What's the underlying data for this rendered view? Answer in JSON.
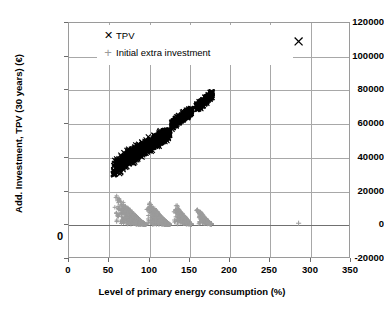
{
  "chart_data": {
    "type": "scatter",
    "title": "",
    "xlabel": "Level of primary energy consumption (%)",
    "ylabel": "Add. Investment, TPV (30 years) (€)",
    "xlim": [
      0,
      350
    ],
    "ylim": [
      -20000,
      120000
    ],
    "xticks": [
      0,
      50,
      100,
      150,
      200,
      250,
      300,
      350
    ],
    "yticks": [
      -20000,
      0,
      20000,
      40000,
      60000,
      80000,
      100000,
      120000
    ],
    "xtick_labels": [
      "0",
      "50",
      "100",
      "150",
      "200",
      "250",
      "300",
      "350"
    ],
    "ytick_labels": [
      "-20000",
      "0",
      "20000",
      "40000",
      "60000",
      "80000",
      "100000",
      "120000"
    ],
    "grid": true,
    "legend_position": "top-left-inside",
    "series": [
      {
        "name": "TPV",
        "marker": "x",
        "color": "#000000",
        "clusters": [
          {
            "x_range": [
              55,
              126
            ],
            "y_range": [
              29500,
              55500
            ],
            "n": 900,
            "shape": "diagonal-wedge"
          },
          {
            "x_range": [
              128,
              153
            ],
            "y_range": [
              56500,
              68500
            ],
            "n": 300,
            "shape": "blob"
          },
          {
            "x_range": [
              159,
              179
            ],
            "y_range": [
              66500,
              78500
            ],
            "n": 180,
            "shape": "blob"
          }
        ],
        "outliers": [
          {
            "x": 287,
            "y": 109000
          }
        ]
      },
      {
        "name": "Initial extra investment",
        "marker": "+",
        "color": "#9b9b9b",
        "clusters": [
          {
            "x_range": [
              56,
              96
            ],
            "y_range": [
              -600,
              20200
            ],
            "n": 520,
            "shape": "descending-wedge"
          },
          {
            "x_range": [
              96,
              126
            ],
            "y_range": [
              -600,
              16500
            ],
            "n": 420,
            "shape": "descending-wedge"
          },
          {
            "x_range": [
              131,
              153
            ],
            "y_range": [
              -400,
              14500
            ],
            "n": 260,
            "shape": "descending-wedge"
          },
          {
            "x_range": [
              158,
              178
            ],
            "y_range": [
              -300,
              11500
            ],
            "n": 170,
            "shape": "descending-wedge"
          }
        ],
        "outliers": [
          {
            "x": 287,
            "y": 200
          }
        ]
      }
    ],
    "legend_entries": [
      {
        "label": "TPV",
        "marker": "✕",
        "color": "#000000"
      },
      {
        "label": "Initial extra investment",
        "marker": "+",
        "color": "#9b9b9b"
      }
    ],
    "annotations": [
      {
        "text": "0",
        "note": "stray bold zero below axis origin"
      }
    ]
  },
  "colors": {
    "tpv": "#000000",
    "initial_extra_investment": "#9b9b9b",
    "grid": "#a8a8a8",
    "frame": "#9a9a9a",
    "background": "#ffffff"
  }
}
